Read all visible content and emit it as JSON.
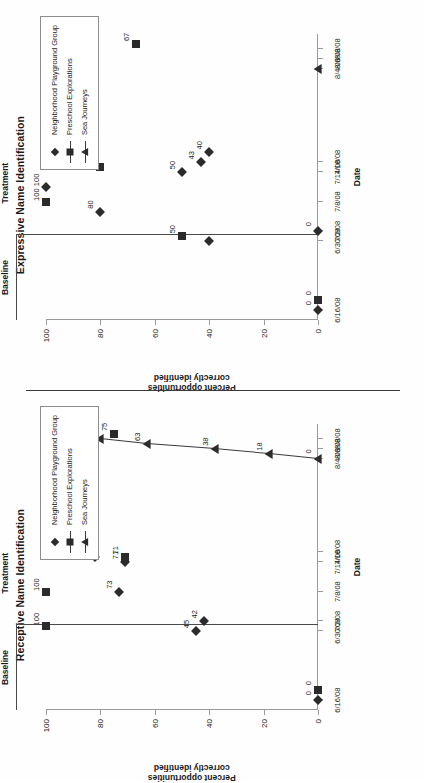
{
  "document": {
    "orientation": "rotated-90-ccw",
    "page_background": "#fefefe",
    "ink_color": "#2b2b2b"
  },
  "axis": {
    "x_title": "Date",
    "y_title_line1": "Percent opportunities",
    "y_title_line2": "correctly identified",
    "x_ticks": [
      "6/16/08",
      "6/30/08",
      "7/2/08",
      "7/8/08",
      "7/14/08",
      "7/16/08",
      "8/4/08",
      "8/6/08",
      "8/8/08"
    ],
    "y_ticks": [
      "0",
      "20",
      "40",
      "60",
      "80",
      "100"
    ],
    "y_min": 0,
    "y_max": 100
  },
  "phases": {
    "baseline_label": "Baseline",
    "treatment_label": "Treatment"
  },
  "legend": {
    "items": [
      {
        "label": "Neighborhood Playground Group",
        "marker": "diamond-marker",
        "line": false
      },
      {
        "label": "Preschool Explorations",
        "marker": "square-marker",
        "line": true
      },
      {
        "label": "Sea Journeys",
        "marker": "triangle-marker",
        "line": true
      }
    ]
  },
  "chart_data": [
    {
      "type": "scatter",
      "title": "Receptive Name Identification",
      "xlabel": "Date",
      "ylabel": "Percent opportunities correctly identified",
      "ylim": [
        0,
        100
      ],
      "grid": false,
      "legend_position": "top-right",
      "categories": [
        "6/16/08",
        "6/30/08",
        "7/2/08",
        "7/8/08",
        "7/14/08",
        "7/16/08",
        "8/4/08",
        "8/6/08",
        "8/8/08"
      ],
      "phase_change_after": "6/30/08",
      "annotations": [
        "Baseline",
        "Treatment"
      ],
      "series": [
        {
          "name": "Neighborhood Playground Group",
          "marker": "diamond",
          "connected": false,
          "points": [
            {
              "x": "6/16/08",
              "y": 0,
              "label": "0"
            },
            {
              "x": "6/30/08",
              "y": 45,
              "label": "45"
            },
            {
              "x": "7/2/08",
              "y": 42,
              "label": "42"
            },
            {
              "x": "7/8/08",
              "y": 73,
              "label": "73"
            },
            {
              "x": "7/14/08",
              "y": 71,
              "label": "71"
            },
            {
              "x": "7/15/08",
              "y": 82,
              "label": "82"
            },
            {
              "x": "7/16/08",
              "y": 86,
              "label": "86"
            },
            {
              "x": "7/18/08",
              "y": 83,
              "label": "83"
            }
          ]
        },
        {
          "name": "Preschool Explorations",
          "marker": "square",
          "connected": false,
          "points": [
            {
              "x": "6/18/08",
              "y": 0,
              "label": "0"
            },
            {
              "x": "7/1/08",
              "y": 100,
              "label": "100"
            },
            {
              "x": "7/8/08",
              "y": 100,
              "label": "100"
            },
            {
              "x": "7/15/08",
              "y": 71,
              "label": "71"
            },
            {
              "x": "8/9/08",
              "y": 75,
              "label": "75"
            }
          ]
        },
        {
          "name": "Sea Journeys",
          "marker": "triangle",
          "connected": true,
          "points": [
            {
              "x": "8/4/08",
              "y": 0,
              "label": "0"
            },
            {
              "x": "8/5/08",
              "y": 18,
              "label": "18"
            },
            {
              "x": "8/6/08",
              "y": 38,
              "label": "38"
            },
            {
              "x": "8/7/08",
              "y": 63,
              "label": "63"
            },
            {
              "x": "8/8/08",
              "y": 80,
              "label": "80"
            }
          ]
        }
      ]
    },
    {
      "type": "scatter",
      "title": "Expressive Name Identification",
      "xlabel": "Date",
      "ylabel": "Percent opportunities correctly identified",
      "ylim": [
        0,
        100
      ],
      "grid": false,
      "legend_position": "top-right",
      "categories": [
        "6/16/08",
        "6/30/08",
        "7/2/08",
        "7/8/08",
        "7/14/08",
        "7/16/08",
        "8/4/08",
        "8/6/08",
        "8/8/08"
      ],
      "phase_change_after": "6/30/08",
      "annotations": [
        "Baseline",
        "Treatment"
      ],
      "series": [
        {
          "name": "Neighborhood Playground Group",
          "marker": "diamond",
          "connected": false,
          "points": [
            {
              "x": "6/16/08",
              "y": 0,
              "label": "0"
            },
            {
              "x": "6/30/08",
              "y": 40,
              "label": ""
            },
            {
              "x": "7/2/08",
              "y": 0,
              "label": "0"
            },
            {
              "x": "7/6/08",
              "y": 80,
              "label": "80"
            },
            {
              "x": "7/11/08",
              "y": 100,
              "label": "100"
            },
            {
              "x": "7/14/08",
              "y": 50,
              "label": "50"
            },
            {
              "x": "7/16/08",
              "y": 43,
              "label": "43"
            },
            {
              "x": "7/18/08",
              "y": 40,
              "label": "40"
            }
          ]
        },
        {
          "name": "Preschool Explorations",
          "marker": "square",
          "connected": false,
          "points": [
            {
              "x": "6/18/08",
              "y": 0,
              "label": "0"
            },
            {
              "x": "7/1/08",
              "y": 50,
              "label": "50"
            },
            {
              "x": "7/8/08",
              "y": 100,
              "label": "100"
            },
            {
              "x": "7/15/08",
              "y": 80,
              "label": "80"
            },
            {
              "x": "8/9/08",
              "y": 67,
              "label": "67"
            }
          ]
        },
        {
          "name": "Sea Journeys",
          "marker": "triangle",
          "connected": false,
          "points": [
            {
              "x": "8/4/08",
              "y": 0,
              "label": ""
            }
          ]
        }
      ]
    }
  ]
}
